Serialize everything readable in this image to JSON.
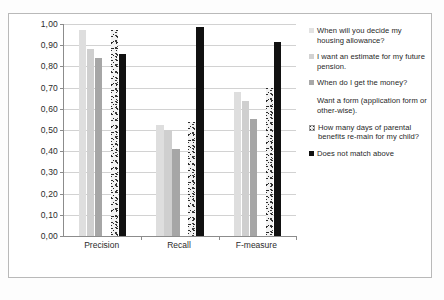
{
  "chart_data": {
    "type": "bar",
    "title": "",
    "subtitle": "",
    "xlabel": "",
    "ylabel": "",
    "ylim": [
      0.0,
      1.0
    ],
    "grid": true,
    "legend_position": "right",
    "categories": [
      "Precision",
      "Recall",
      "F-measure"
    ],
    "ytick_labels": [
      "1,00",
      "0,90",
      "0,80",
      "0,70",
      "0,60",
      "0,50",
      "0,40",
      "0,30",
      "0,20",
      "0,10",
      "0,00"
    ],
    "ytick_values": [
      1.0,
      0.9,
      0.8,
      0.7,
      0.6,
      0.5,
      0.4,
      0.3,
      0.2,
      0.1,
      0.0
    ],
    "series": [
      {
        "name": "When will you decide my housing allowance?",
        "color": "#dedede",
        "values": [
          0.97,
          0.525,
          0.68
        ]
      },
      {
        "name": "I want an estimate for my future pension.",
        "color": "#cfcfcf",
        "values": [
          0.88,
          0.5,
          0.635
        ]
      },
      {
        "name": "When do I get the money?",
        "color": "#a6a6a6",
        "values": [
          0.84,
          0.41,
          0.55
        ]
      },
      {
        "name": "Want a form (application form or other-wise).",
        "color": "#ffffff",
        "values": [
          0.0,
          0.0,
          0.0
        ]
      },
      {
        "name": "How many days of parental benefits re-main for my child?",
        "color": "#f2f2f2",
        "pattern": "dotted",
        "values": [
          0.97,
          0.54,
          0.7
        ]
      },
      {
        "name": "Does not match above",
        "color": "#111111",
        "values": [
          0.86,
          0.985,
          0.915
        ]
      }
    ]
  },
  "legend": {
    "items": [
      {
        "label": "When will you decide my housing allowance?"
      },
      {
        "label": "I want an estimate for my future pension."
      },
      {
        "label": "When do I get the money?"
      },
      {
        "label": "Want a form (application form or other-wise)."
      },
      {
        "label": "How many days of parental benefits re-main for my child?"
      },
      {
        "label": "Does not match above"
      }
    ]
  }
}
